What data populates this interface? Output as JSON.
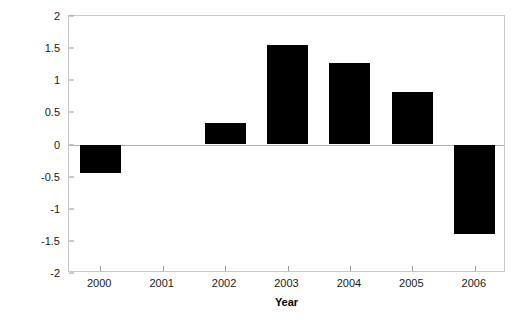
{
  "chart_data": {
    "type": "bar",
    "title": "",
    "xlabel": "Year",
    "ylabel": "Index of May SST",
    "categories": [
      "2000",
      "2001",
      "2002",
      "2003",
      "2004",
      "2005",
      "2006"
    ],
    "values": [
      -0.45,
      0,
      0.34,
      1.55,
      1.27,
      0.81,
      -1.4
    ],
    "series": [
      {
        "name": "Index of May SST",
        "values": [
          -0.45,
          0,
          0.34,
          1.55,
          1.27,
          0.81,
          -1.4
        ]
      }
    ],
    "ylim": [
      -2,
      2
    ],
    "yticks": [
      2,
      1.5,
      1,
      0.5,
      0,
      -0.5,
      -1,
      -1.5,
      -2
    ],
    "ytick_labels": [
      "2",
      "1.5",
      "1",
      "0.5",
      "0",
      "-0.5",
      "-1",
      "-1.5",
      "-2"
    ],
    "grid": false,
    "legend": false,
    "legend_position": "none",
    "bar_color": "#000000",
    "frame_color": "#c9c9c9",
    "axis_color": "#9a9a9a",
    "zero_line_color": "#b0b0b0"
  }
}
